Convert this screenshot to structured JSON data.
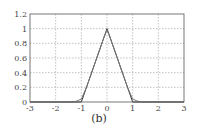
{
  "chart_data": {
    "type": "line",
    "title": "",
    "caption": "(b)",
    "xlabel": "",
    "ylabel": "",
    "xlim": [
      -3,
      3
    ],
    "ylim": [
      0,
      1.2
    ],
    "xticks": [
      -3,
      -2,
      -1,
      0,
      1,
      2,
      3
    ],
    "yticks": [
      0,
      0.2,
      0.4,
      0.6,
      0.8,
      1,
      1.2
    ],
    "xtick_labels": [
      "-3",
      "-2",
      "-1",
      "0",
      "1",
      "2",
      "3"
    ],
    "ytick_labels": [
      "0",
      "0.2",
      "0.4",
      "0.6",
      "0.8",
      "1",
      "1.2"
    ],
    "grid": true,
    "legend": null,
    "series": [
      {
        "name": "triangle",
        "color": "#333333",
        "x": [
          -3,
          -1,
          0,
          1,
          3
        ],
        "y": [
          0,
          0,
          1,
          0,
          0
        ]
      },
      {
        "name": "smoothed",
        "color": "#777777",
        "x": [
          -3,
          -1.4,
          -1.2,
          -1.0,
          -0.8,
          -0.6,
          -0.4,
          -0.2,
          -0.1,
          0,
          0.1,
          0.2,
          0.4,
          0.6,
          0.8,
          1.0,
          1.2,
          1.4,
          3
        ],
        "y": [
          0,
          0.0,
          0.01,
          0.04,
          0.2,
          0.4,
          0.6,
          0.8,
          0.9,
          0.98,
          0.9,
          0.8,
          0.6,
          0.4,
          0.2,
          0.04,
          0.01,
          0.0,
          0
        ]
      }
    ]
  },
  "caption": "(b)"
}
